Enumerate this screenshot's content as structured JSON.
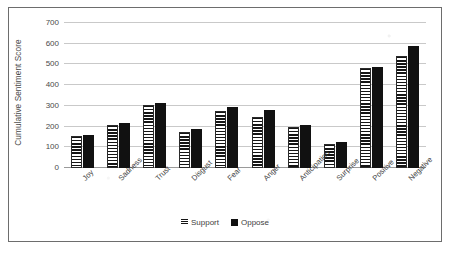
{
  "chart_data": {
    "type": "bar",
    "title": "",
    "xlabel": "",
    "ylabel": "Cumulative Sentiment Score",
    "ylim": [
      0,
      700
    ],
    "ytick_step": 100,
    "yticks": [
      700,
      600,
      500,
      400,
      300,
      200,
      100,
      0
    ],
    "ytick_labels": [
      "700",
      "600",
      "500",
      "400",
      "300",
      "200",
      "100",
      "0"
    ],
    "grid": true,
    "legend_position": "bottom",
    "categories": [
      "Joy",
      "Sadness",
      "Trust",
      "Disgust",
      "Fear",
      "Anger",
      "Anticipation",
      "Surprise",
      "Positive",
      "Negative"
    ],
    "series": [
      {
        "name": "Support",
        "pattern": "horizontal-stripes",
        "color": "#151515",
        "values": [
          155,
          208,
          303,
          172,
          275,
          247,
          200,
          115,
          482,
          543
        ]
      },
      {
        "name": "Oppose",
        "pattern": "solid",
        "color": "#111111",
        "values": [
          158,
          215,
          312,
          186,
          293,
          278,
          207,
          128,
          490,
          587
        ]
      }
    ]
  },
  "legend": {
    "entries": [
      {
        "label": "Support",
        "swatch": "striped-swatch-icon"
      },
      {
        "label": "Oppose",
        "swatch": "solid-swatch-icon"
      }
    ]
  },
  "colors": {
    "frame": "#6d6d6d",
    "gridline": "#c9c9c9",
    "axis_text": "#4a4a4a",
    "bar_oppose": "#111111",
    "bar_support_stripe": "#151515",
    "background": "#ffffff"
  }
}
